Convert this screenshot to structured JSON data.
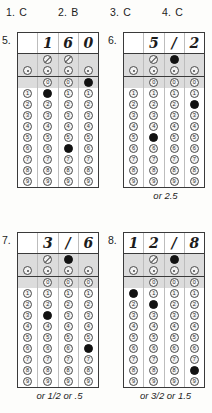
{
  "multiple_choice": [
    {
      "number": "1.",
      "answer": "C"
    },
    {
      "number": "2.",
      "answer": "B"
    },
    {
      "number": "3.",
      "answer": "C"
    },
    {
      "number": "4.",
      "answer": "C"
    }
  ],
  "grid_columns": 4,
  "digit_labels": [
    "0",
    "1",
    "2",
    "3",
    "4",
    "5",
    "6",
    "7",
    "8",
    "9"
  ],
  "symbols": {
    "fraction_bar": "/",
    "decimal_point": "."
  },
  "grids": [
    {
      "number": "5.",
      "written": [
        "",
        "1",
        "6",
        "0"
      ],
      "filled": [
        "",
        "1",
        "6",
        "0"
      ],
      "alt": ""
    },
    {
      "number": "6.",
      "written": [
        "",
        "5",
        "/",
        "2"
      ],
      "filled": [
        "",
        "5",
        "/",
        "2"
      ],
      "alt": "or 2.5"
    },
    {
      "number": "7.",
      "written": [
        "",
        "3",
        "/",
        "6"
      ],
      "filled": [
        "",
        "3",
        "/",
        "6"
      ],
      "alt": "or 1/2 or .5"
    },
    {
      "number": "8.",
      "written": [
        "1",
        "2",
        "/",
        "8"
      ],
      "filled": [
        "1",
        "2",
        "/",
        "8"
      ],
      "alt": "or 3/2 or 1.5"
    }
  ]
}
